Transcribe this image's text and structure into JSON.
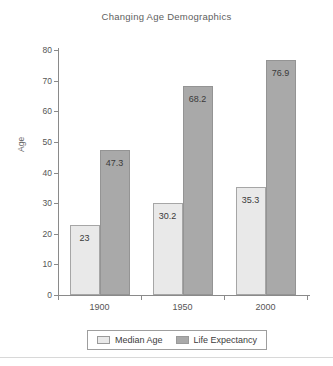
{
  "chart_data": {
    "type": "bar",
    "title": "Changing Age Demographics",
    "xlabel": "",
    "ylabel": "Age",
    "categories": [
      "1900",
      "1950",
      "2000"
    ],
    "series": [
      {
        "name": "Median Age",
        "values": [
          23,
          30.2,
          35.3
        ],
        "color": "#e9e9e9"
      },
      {
        "name": "Life Expectancy",
        "values": [
          47.3,
          68.2,
          76.9
        ],
        "color": "#a9a9a9"
      }
    ],
    "value_labels": [
      [
        "23",
        "30.2",
        "35.3"
      ],
      [
        "47.3",
        "68.2",
        "76.9"
      ]
    ],
    "ylim": [
      0,
      80
    ],
    "yticks": [
      0,
      10,
      20,
      30,
      40,
      50,
      60,
      70,
      80
    ],
    "ytick_labels": [
      "0",
      "10",
      "20",
      "30",
      "40",
      "50",
      "60",
      "70",
      "80"
    ],
    "grid": false,
    "legend_position": "bottom"
  }
}
